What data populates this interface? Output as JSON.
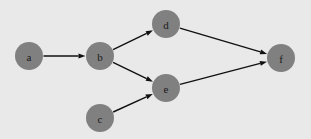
{
  "diagram": {
    "type": "directed-graph",
    "background_color": "#e9e9e9",
    "node_color": "#808080",
    "edge_color": "#111111",
    "label_color": "#1a1a1a",
    "node_radius": 14,
    "edge_width": 1.4,
    "arrowhead_length": 7,
    "arrowhead_width": 5,
    "nodes": [
      {
        "id": "a",
        "label": "a",
        "x": 29,
        "y": 56
      },
      {
        "id": "b",
        "label": "b",
        "x": 100,
        "y": 56
      },
      {
        "id": "c",
        "label": "c",
        "x": 100,
        "y": 118
      },
      {
        "id": "d",
        "label": "d",
        "x": 166,
        "y": 24
      },
      {
        "id": "e",
        "label": "e",
        "x": 166,
        "y": 88
      },
      {
        "id": "f",
        "label": "f",
        "x": 281,
        "y": 58
      }
    ],
    "edges": [
      {
        "id": "a-b",
        "from": "a",
        "to": "b",
        "directed": true
      },
      {
        "id": "b-d",
        "from": "b",
        "to": "d",
        "directed": true
      },
      {
        "id": "b-e",
        "from": "b",
        "to": "e",
        "directed": true
      },
      {
        "id": "c-e",
        "from": "c",
        "to": "e",
        "directed": true
      },
      {
        "id": "d-f",
        "from": "d",
        "to": "f",
        "directed": true
      },
      {
        "id": "e-f",
        "from": "e",
        "to": "f",
        "directed": true
      }
    ]
  }
}
